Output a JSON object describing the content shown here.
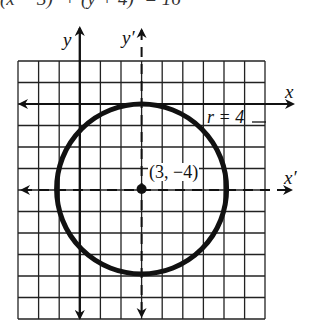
{
  "caption_cut": "(x − 3)² + (y + 4)² = 16",
  "axes": {
    "x_label": "x",
    "y_label": "y",
    "xprime_label": "x′",
    "yprime_label": "y′"
  },
  "annotations": {
    "radius_label": "r = 4",
    "center_label": "(3, −4)"
  },
  "grid": {
    "columns": 12,
    "rows": 12,
    "left": 18,
    "top": 61,
    "cell": 20.6
  },
  "circle": {
    "center": [
      3,
      -4
    ],
    "radius": 4
  },
  "colors": {
    "ink": "#111111",
    "grid": "#222222",
    "background": "#ffffff"
  }
}
